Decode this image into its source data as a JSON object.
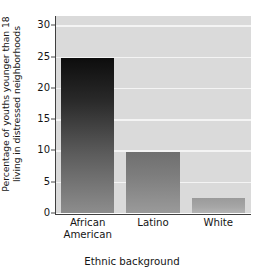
{
  "chart_data": {
    "type": "bar",
    "title": "",
    "xlabel": "Ethnic background",
    "ylabel": "Percentage of youths younger than 18 living in distressed neighborhoods",
    "ylabel_line1": "Percentage of youths younger than 18",
    "ylabel_line2": "living in distressed neighborhoods",
    "categories": [
      "African American",
      "Latino",
      "White"
    ],
    "category_lines": [
      [
        "African",
        "American"
      ],
      [
        "Latino"
      ],
      [
        "White"
      ]
    ],
    "values": [
      24.8,
      9.8,
      2.4
    ],
    "ylim": [
      0,
      31.5
    ],
    "yticks": [
      0,
      5,
      10,
      15,
      20,
      25,
      30
    ],
    "ytick_labels": [
      "0",
      "5",
      "10",
      "15",
      "20",
      "25",
      "30"
    ],
    "grid": true,
    "grid_axis": "y",
    "legend": false,
    "legend_position": "none",
    "bar_fill_style": "vertical-gradient-dark-to-light",
    "series": [
      {
        "name": "Percentage in distressed neighborhoods",
        "values": [
          24.8,
          9.8,
          2.4
        ]
      }
    ]
  },
  "style": {
    "plot_background": "#dadada",
    "gridline_color": "#f4f4f4",
    "axis_color": "#3f3f3f",
    "text_color": "#151515",
    "page_background": "#ffffff",
    "bar_colors": [
      {
        "top": "#0d0d0d",
        "bottom": "#8d8d8d"
      },
      {
        "top": "#6f6f6f",
        "bottom": "#9a9a9a"
      },
      {
        "top": "#9a9a9a",
        "bottom": "#b4b4b4"
      }
    ]
  }
}
